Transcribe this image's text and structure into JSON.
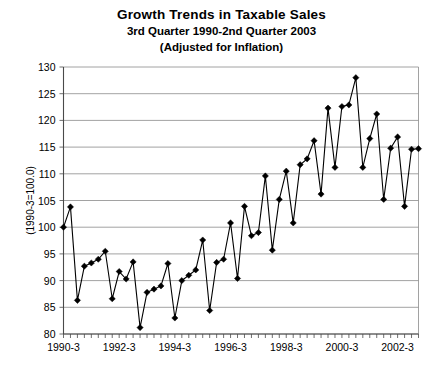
{
  "title": {
    "line1": "Growth Trends in Taxable Sales",
    "line2": "3rd Quarter 1990-2nd Quarter 2003",
    "line3": "(Adjusted for Inflation)"
  },
  "chart_data": {
    "type": "line",
    "title": "Growth Trends in Taxable Sales",
    "subtitle": "3rd Quarter 1990-2nd Quarter 2003 (Adjusted for Inflation)",
    "xlabel": "",
    "ylabel": "(1990-3=100.0)",
    "ylim": [
      80,
      130
    ],
    "yticks": [
      80,
      85,
      90,
      95,
      100,
      105,
      110,
      115,
      120,
      125,
      130
    ],
    "grid": true,
    "legend": "none",
    "marker": "diamond",
    "line_color": "#000000",
    "marker_color": "#000000",
    "grid_color": "#8a8a8a",
    "x_tick_labels": [
      "1990-3",
      "1992-3",
      "1994-3",
      "1996-3",
      "1998-3",
      "2000-3",
      "2002-3"
    ],
    "x_tick_indices": [
      0,
      8,
      16,
      24,
      32,
      40,
      48
    ],
    "x": [
      "1990-3",
      "1990-4",
      "1991-1",
      "1991-2",
      "1991-3",
      "1991-4",
      "1992-1",
      "1992-2",
      "1992-3",
      "1992-4",
      "1993-1",
      "1993-2",
      "1993-3",
      "1993-4",
      "1994-1",
      "1994-2",
      "1994-3",
      "1994-4",
      "1995-1",
      "1995-2",
      "1995-3",
      "1995-4",
      "1996-1",
      "1996-2",
      "1996-3",
      "1996-4",
      "1997-1",
      "1997-2",
      "1997-3",
      "1997-4",
      "1998-1",
      "1998-2",
      "1998-3",
      "1998-4",
      "1999-1",
      "1999-2",
      "1999-3",
      "1999-4",
      "2000-1",
      "2000-2",
      "2000-3",
      "2000-4",
      "2001-1",
      "2001-2",
      "2001-3",
      "2001-4",
      "2002-1",
      "2002-2",
      "2002-3",
      "2002-4",
      "2003-1",
      "2003-2"
    ],
    "values": [
      100.0,
      103.8,
      86.3,
      92.7,
      93.3,
      94.0,
      95.5,
      86.6,
      91.7,
      90.3,
      93.5,
      81.2,
      87.8,
      88.4,
      89.0,
      93.2,
      83.0,
      90.0,
      91.0,
      92.0,
      97.6,
      84.4,
      93.4,
      94.0,
      100.8,
      90.4,
      103.9,
      98.4,
      99.0,
      109.6,
      95.7,
      105.2,
      110.5,
      100.8,
      111.7,
      112.8,
      116.2,
      106.2,
      122.3,
      111.2,
      122.6,
      122.9,
      128.0,
      111.2,
      116.6,
      121.2,
      105.2,
      114.8,
      116.9,
      103.9,
      114.6,
      114.7
    ]
  }
}
